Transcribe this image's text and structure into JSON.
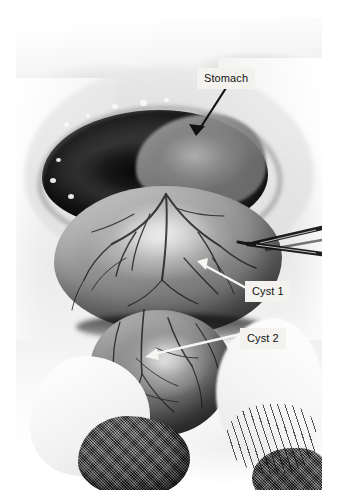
{
  "image": {
    "type": "clinical-photograph",
    "modality": "intraoperative-photo",
    "color": "black-and-white",
    "subject": "Surgical exposure of abdomen showing stomach and two cystic masses",
    "background_color": "#ffffff",
    "plate": {
      "left": 16,
      "top": 18,
      "width": 306,
      "height": 472
    }
  },
  "annotations": [
    {
      "id": "stomach",
      "label": "Stomach",
      "arrow": "black-arrow",
      "arrow_from": [
        226,
        88
      ],
      "arrow_to": [
        196,
        134
      ],
      "box": {
        "left": 197,
        "top": 68,
        "width": 56,
        "height": 19
      }
    },
    {
      "id": "cyst1",
      "label": "Cyst 1",
      "arrow": "white-arrow",
      "arrow_from": [
        246,
        288
      ],
      "arrow_to": [
        198,
        262
      ],
      "box": {
        "left": 245,
        "top": 281,
        "width": 48,
        "height": 19
      }
    },
    {
      "id": "cyst2",
      "label": "Cyst 2",
      "arrow": "white-arrow",
      "arrow_from": [
        240,
        334
      ],
      "arrow_to": [
        146,
        357
      ],
      "box": {
        "left": 240,
        "top": 328,
        "width": 48,
        "height": 19
      }
    }
  ],
  "scene_elements": [
    {
      "name": "stomach",
      "description": "Stomach wall exposed within the laparotomy opening"
    },
    {
      "name": "cyst-1",
      "description": "Large upper cystic mass with prominent surface vasculature"
    },
    {
      "name": "cyst-2",
      "description": "Smaller lower cystic mass with surface vasculature"
    },
    {
      "name": "wound-opening",
      "description": "Dark peritoneal/laparotomy opening"
    },
    {
      "name": "surgical-forceps",
      "description": "Metal clamp/forceps at upper right of field"
    },
    {
      "name": "surgical-gauze",
      "description": "Dark textured gauze sponge at lower left"
    },
    {
      "name": "gloved-hand",
      "description": "Gloved hand retracting tissue at lower left"
    },
    {
      "name": "surgical-drapes",
      "description": "Pale drapes surrounding the operative field"
    }
  ],
  "colors": {
    "label_background": "#f3f2ee",
    "label_text": "#111111",
    "black_arrow": "#111111",
    "white_arrow": "#f6f5f1",
    "page_background": "#ffffff"
  }
}
